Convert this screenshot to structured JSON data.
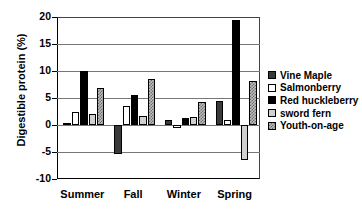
{
  "chart_data": {
    "type": "bar",
    "title": "",
    "xlabel": "",
    "ylabel": "Digestible protein (%)",
    "categories": [
      "Summer",
      "Fall",
      "Winter",
      "Spring"
    ],
    "ylim": [
      -10,
      20
    ],
    "yticks": [
      20,
      15,
      10,
      5,
      0,
      -5,
      -10
    ],
    "grid": true,
    "legend_position": "right",
    "series": [
      {
        "name": "Vine Maple",
        "values": [
          0.4,
          -5.3,
          1.0,
          4.5
        ],
        "fill": "dark-gray-solid",
        "color": "#3a3a3a"
      },
      {
        "name": "Salmonberry",
        "values": [
          2.4,
          3.5,
          -0.5,
          0.9
        ],
        "fill": "white",
        "color": "#ffffff"
      },
      {
        "name": "Red huckleberry",
        "values": [
          10.0,
          5.5,
          1.3,
          19.5
        ],
        "fill": "black",
        "color": "#000000"
      },
      {
        "name": "sword fern",
        "values": [
          2.1,
          1.6,
          1.5,
          -6.5
        ],
        "fill": "light-gray",
        "color": "#d0d0d0"
      },
      {
        "name": "Youth-on-age",
        "values": [
          6.8,
          8.5,
          4.3,
          8.1
        ],
        "fill": "checkered-gray",
        "color": "#bdbdbd"
      }
    ]
  }
}
